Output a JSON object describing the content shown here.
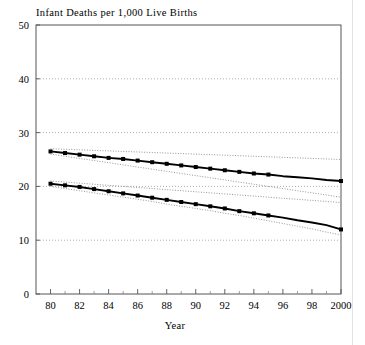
{
  "figure": {
    "cropped_header_text": "",
    "y_axis_title": "Infant Deaths per 1,000 Live Births",
    "x_axis_title": "Year"
  },
  "chart_data": {
    "type": "line",
    "title": "Infant Deaths per 1,000 Live Births",
    "xlabel": "Year",
    "ylabel": "Infant Deaths per 1,000 Live Births",
    "xlim": [
      1979,
      2000
    ],
    "ylim": [
      0,
      50
    ],
    "yticks": [
      0,
      10,
      20,
      30,
      40,
      50
    ],
    "ytick_labels": [
      "0",
      "10",
      "20",
      "30",
      "40",
      "50"
    ],
    "xticks": [
      1980,
      1982,
      1984,
      1986,
      1988,
      1990,
      1992,
      1994,
      1996,
      1998,
      2000
    ],
    "xtick_labels": [
      "80",
      "82",
      "84",
      "86",
      "88",
      "90",
      "92",
      "94",
      "96",
      "98",
      "2000"
    ],
    "minor_xticks": [
      1981,
      1983,
      1985,
      1987,
      1989,
      1991,
      1993,
      1995,
      1997,
      1999
    ],
    "grid": "horizontal-dotted",
    "legend": "none",
    "x": [
      1980,
      1981,
      1982,
      1983,
      1984,
      1985,
      1986,
      1987,
      1988,
      1989,
      1990,
      1991,
      1992,
      1993,
      1994,
      1995,
      1996,
      1997,
      1998,
      1999,
      2000
    ],
    "series": [
      {
        "name": "upper-series",
        "marker": "filled-square",
        "marker_last_x": 1995,
        "style": "solid",
        "values": [
          26.5,
          26.2,
          25.9,
          25.6,
          25.3,
          25.1,
          24.8,
          24.5,
          24.2,
          23.9,
          23.6,
          23.3,
          23.0,
          22.7,
          22.4,
          22.2,
          21.9,
          21.7,
          21.5,
          21.2,
          21.0
        ]
      },
      {
        "name": "upper-series-upper-bound",
        "style": "dotted",
        "values": [
          27.0,
          26.9,
          26.8,
          26.7,
          26.6,
          26.5,
          26.4,
          26.3,
          26.2,
          26.1,
          26.0,
          25.9,
          25.8,
          25.7,
          25.6,
          25.5,
          25.4,
          25.3,
          25.2,
          25.1,
          25.0
        ]
      },
      {
        "name": "upper-series-lower-bound",
        "style": "dotted",
        "values": [
          26.0,
          25.6,
          25.2,
          24.8,
          24.4,
          24.0,
          23.6,
          23.2,
          22.8,
          22.4,
          22.0,
          21.6,
          21.2,
          20.8,
          20.4,
          20.0,
          19.6,
          19.2,
          18.8,
          18.4,
          18.0
        ]
      },
      {
        "name": "lower-series",
        "marker": "filled-square",
        "marker_last_x": 1995,
        "style": "solid",
        "values": [
          20.5,
          20.2,
          19.9,
          19.5,
          19.1,
          18.7,
          18.3,
          17.9,
          17.5,
          17.1,
          16.7,
          16.3,
          15.9,
          15.4,
          15.0,
          14.6,
          14.2,
          13.7,
          13.3,
          12.8,
          12.0
        ]
      },
      {
        "name": "lower-series-upper-bound",
        "style": "dotted",
        "values": [
          21.0,
          20.8,
          20.6,
          20.4,
          20.2,
          20.0,
          19.8,
          19.6,
          19.4,
          19.2,
          19.0,
          18.8,
          18.6,
          18.4,
          18.2,
          18.0,
          17.8,
          17.6,
          17.4,
          17.2,
          17.0
        ]
      },
      {
        "name": "lower-series-lower-bound",
        "style": "dotted",
        "values": [
          20.0,
          19.6,
          19.2,
          18.8,
          18.4,
          18.0,
          17.6,
          17.2,
          16.7,
          16.3,
          15.9,
          15.5,
          15.0,
          14.6,
          14.1,
          13.6,
          13.1,
          12.6,
          12.1,
          11.5,
          11.0
        ]
      }
    ]
  }
}
